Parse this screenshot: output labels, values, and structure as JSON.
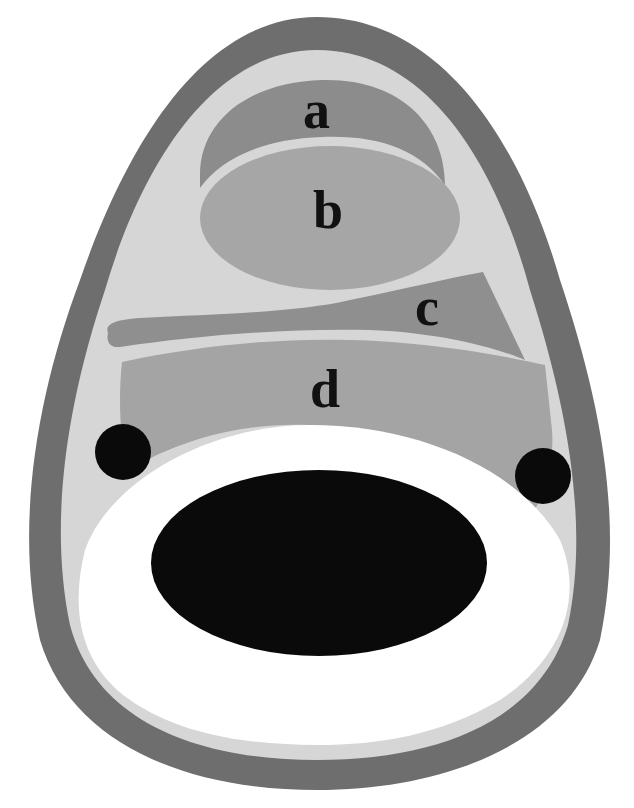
{
  "diagram": {
    "type": "labeled cross-section schematic",
    "labels": {
      "a": "a",
      "b": "b",
      "c": "c",
      "d": "d"
    },
    "colors": {
      "background": "#ffffff",
      "outer_shell": "#6e6e6e",
      "interior": "#d6d6d6",
      "region_a": "#8c8c8c",
      "region_b": "#a6a6a6",
      "region_c": "#8f8f8f",
      "region_d": "#a4a4a4",
      "white_ring": "#ffffff",
      "central_ellipse": "#0a0a0a",
      "dots": "#0a0a0a",
      "label_text": "#111111"
    }
  }
}
